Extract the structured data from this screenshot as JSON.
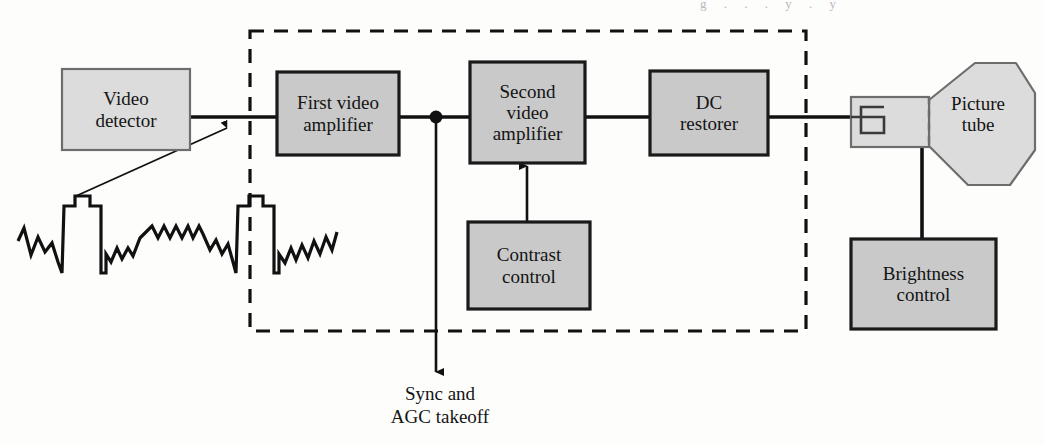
{
  "figure": {
    "canvas": {
      "width": 1044,
      "height": 445
    },
    "colors": {
      "page_background": "#fdfdfc",
      "block_fill_light": "#dcdcdc",
      "block_fill_dark": "#c9c9c9",
      "block_stroke_light": "#6d6d6d",
      "block_stroke_dark": "#1a1a1a",
      "line": "#111111",
      "dashed_boundary": "#111111",
      "text": "#141414"
    }
  },
  "blocks": {
    "video_detector": {
      "label": "Video\ndetector",
      "x": 62,
      "y": 69,
      "w": 128,
      "h": 81,
      "fill": "#dcdcdc",
      "stroke": "#6d6d6d",
      "stroke_width": 2.2,
      "font_size": 19
    },
    "first_video_amplifier": {
      "label": "First video\namplifier",
      "x": 277,
      "y": 72,
      "w": 122,
      "h": 83,
      "fill": "#c9c9c9",
      "stroke": "#1a1a1a",
      "stroke_width": 3.2,
      "font_size": 19
    },
    "second_video_amplifier": {
      "label": "Second\nvideo\namplifier",
      "x": 470,
      "y": 62,
      "w": 115,
      "h": 101,
      "fill": "#c9c9c9",
      "stroke": "#1a1a1a",
      "stroke_width": 3.2,
      "font_size": 19
    },
    "dc_restorer": {
      "label": "DC\nrestorer",
      "x": 650,
      "y": 71,
      "w": 118,
      "h": 84,
      "fill": "#c9c9c9",
      "stroke": "#1a1a1a",
      "stroke_width": 3.2,
      "font_size": 19
    },
    "contrast_control": {
      "label": "Contrast\ncontrol",
      "x": 468,
      "y": 222,
      "w": 122,
      "h": 87,
      "fill": "#c9c9c9",
      "stroke": "#1a1a1a",
      "stroke_width": 3.2,
      "font_size": 19
    },
    "brightness_control": {
      "label": "Brightness\ncontrol",
      "x": 851,
      "y": 239,
      "w": 145,
      "h": 90,
      "fill": "#c9c9c9",
      "stroke": "#1a1a1a",
      "stroke_width": 3.2,
      "font_size": 19
    },
    "picture_tube": {
      "label": "Picture\ntube",
      "label_x": 930,
      "label_y": 88,
      "label_w": 96,
      "label_h": 52,
      "neck": {
        "x": 851,
        "y": 97,
        "w": 78,
        "h": 50
      },
      "cone_points": "929,100 975,63 1016,63 1035,93 1035,150 1010,185 968,185 929,146",
      "fill": "#dcdcdc",
      "stroke": "#6d6d6d",
      "stroke_width": 2.2,
      "font_size": 19
    }
  },
  "boundary": {
    "name": "video-section-dashed-boundary",
    "x": 250,
    "y": 31,
    "w": 556,
    "h": 300,
    "dash": "14 10",
    "stroke_width": 3.2
  },
  "annotations": {
    "sync_takeoff": {
      "label": "Sync and\nAGC takeoff",
      "x": 330,
      "y": 383,
      "w": 220,
      "h": 56,
      "font_size": 19
    }
  },
  "waveform": {
    "name": "composite-video-waveform",
    "description": "Composite video signal with two horizontal sync pulses and picture information between them",
    "stroke_width": 3.2,
    "points": "18,241 24,228 31,255 38,237 45,252 52,243 58,262 62,273 64,206 75,206 75,196 90,196 90,206 101,206 101,273 106,273 106,254 111,262 117,248 122,259 128,248 133,256 140,238 152,226 158,238 164,226 170,238 176,226 182,238 188,226 193,238 199,226 203,234 210,250 216,240 222,254 228,244 233,262 236,273 238,206 249,206 249,196 263,196 263,206 274,206 274,273 279,273 279,254 285,263 291,248 296,260 302,245 308,258 314,241 320,254 326,237 332,250 337,232"
  },
  "connectors": [
    {
      "name": "detector-to-first-amp",
      "type": "line",
      "points": "190,117 277,117"
    },
    {
      "name": "first-amp-to-junction",
      "type": "line",
      "points": "399,117 470,117"
    },
    {
      "name": "second-amp-to-dc-restorer",
      "type": "line",
      "points": "585,117 650,117"
    },
    {
      "name": "dc-restorer-to-picture-tube",
      "type": "line",
      "points": "768,117 851,117"
    },
    {
      "name": "sync-takeoff-drop",
      "type": "arrow-down",
      "points": "436,117 436,372"
    },
    {
      "name": "contrast-to-second-amp",
      "type": "arrow-up",
      "points": "527,222 527,166"
    },
    {
      "name": "picture-tube-to-brightness",
      "type": "line",
      "points": "922,147 922,239"
    },
    {
      "name": "waveform-callout-arrow",
      "type": "arrow-up-right",
      "points": "76,196 227,128"
    }
  ],
  "junction_dots": [
    {
      "name": "video-signal-junction-dot",
      "cx": 436,
      "cy": 117,
      "r": 6.5
    }
  ],
  "crt_gun_symbol": {
    "name": "electron-gun-symbol",
    "points": "851,117 884,117 884,133 861,133 861,107 884,107"
  },
  "scan_artifact": {
    "top_text": "g . . . y . y"
  }
}
